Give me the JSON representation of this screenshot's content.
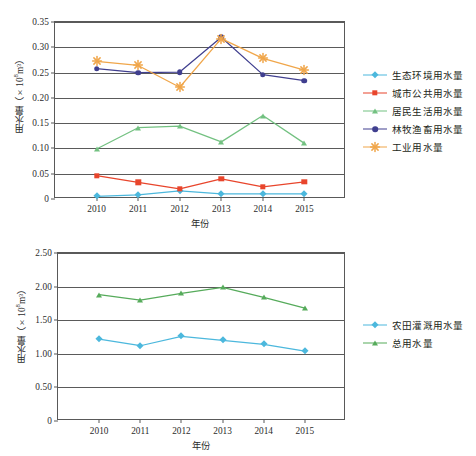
{
  "figure": {
    "background": "#ffffff",
    "width": 476,
    "height": 456
  },
  "chart_data": [
    {
      "id": "top",
      "type": "line",
      "title": "",
      "xlabel": "年份",
      "ylabel": "用水量（×10⁸m³）",
      "ylabel_prefix": "用水量（×10",
      "ylabel_exp": "8",
      "ylabel_suffix": "m³）",
      "categories": [
        "2010",
        "2011",
        "2012",
        "2013",
        "2014",
        "2015"
      ],
      "x": [
        2010,
        2011,
        2012,
        2013,
        2014,
        2015
      ],
      "ylim": [
        0,
        0.35
      ],
      "yticks": [
        "0",
        "0.05",
        "0.10",
        "0.15",
        "0.20",
        "0.25",
        "0.30",
        "0.35"
      ],
      "ytick_values": [
        0,
        0.05,
        0.1,
        0.15,
        0.2,
        0.25,
        0.3,
        0.35
      ],
      "grid": true,
      "legend_position": "right",
      "series": [
        {
          "name": "生态环境用水量",
          "color": "#4cb8dd",
          "marker": "diamond",
          "values": [
            0.005,
            0.008,
            0.016,
            0.01,
            0.01,
            0.01
          ]
        },
        {
          "name": "城市公共用水量",
          "color": "#e8452c",
          "marker": "square",
          "values": [
            0.046,
            0.033,
            0.02,
            0.04,
            0.024,
            0.034
          ]
        },
        {
          "name": "居民生活用水量",
          "color": "#73c181",
          "marker": "triangle",
          "values": [
            0.099,
            0.141,
            0.144,
            0.113,
            0.165,
            0.11
          ]
        },
        {
          "name": "林牧渔畜用水量",
          "color": "#403f8f",
          "marker": "circle",
          "values": [
            0.258,
            0.25,
            0.251,
            0.32,
            0.246,
            0.234
          ]
        },
        {
          "name": "工业用水量",
          "color": "#f0a64a",
          "marker": "star",
          "values": [
            0.272,
            0.264,
            0.221,
            0.317,
            0.278,
            0.255
          ]
        }
      ]
    },
    {
      "id": "bottom",
      "type": "line",
      "title": "",
      "xlabel": "年份",
      "ylabel": "用水量（×10⁸m³）",
      "ylabel_prefix": "用水量（×10",
      "ylabel_exp": "8",
      "ylabel_suffix": "m³）",
      "categories": [
        "2010",
        "2011",
        "2012",
        "2013",
        "2014",
        "2015"
      ],
      "x": [
        2010,
        2011,
        2012,
        2013,
        2014,
        2015
      ],
      "ylim": [
        0,
        2.5
      ],
      "yticks": [
        "0",
        "0.50",
        "1.00",
        "1.50",
        "2.00",
        "2.50"
      ],
      "ytick_values": [
        0,
        0.5,
        1.0,
        1.5,
        2.0,
        2.5
      ],
      "grid": true,
      "legend_position": "right",
      "series": [
        {
          "name": "农田灌溉用水量",
          "color": "#4cb8dd",
          "marker": "diamond",
          "values": [
            1.22,
            1.12,
            1.26,
            1.2,
            1.14,
            1.04
          ]
        },
        {
          "name": "总用水量",
          "color": "#56ab5b",
          "marker": "triangle",
          "values": [
            1.88,
            1.8,
            1.9,
            1.99,
            1.84,
            1.68
          ]
        }
      ]
    }
  ]
}
